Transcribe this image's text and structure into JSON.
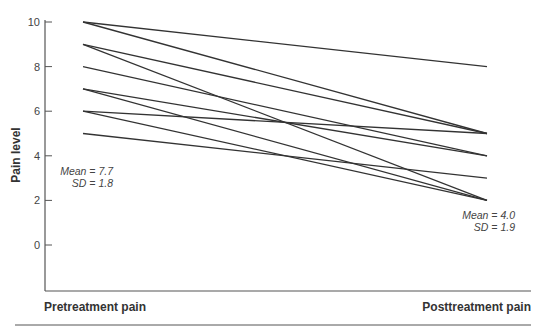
{
  "chart_data": {
    "type": "line",
    "title": "",
    "xlabel": "",
    "ylabel": "Pain level",
    "categories": [
      "Pretreatment pain",
      "Posttreatment pain"
    ],
    "ylim": [
      -2,
      10
    ],
    "yticks": [
      0,
      2,
      4,
      6,
      8,
      10
    ],
    "grid": false,
    "legend": null,
    "series": [
      {
        "name": "Patient 1",
        "values": [
          10,
          8
        ]
      },
      {
        "name": "Patient 2",
        "values": [
          10,
          5
        ]
      },
      {
        "name": "Patient 3",
        "values": [
          9,
          5
        ]
      },
      {
        "name": "Patient 4",
        "values": [
          9,
          2
        ]
      },
      {
        "name": "Patient 5",
        "values": [
          8,
          4
        ]
      },
      {
        "name": "Patient 6",
        "values": [
          7,
          4
        ]
      },
      {
        "name": "Patient 7",
        "values": [
          7,
          2
        ]
      },
      {
        "name": "Patient 8",
        "values": [
          6,
          5
        ]
      },
      {
        "name": "Patient 9",
        "values": [
          6,
          2
        ]
      },
      {
        "name": "Patient 10",
        "values": [
          5,
          3
        ]
      }
    ],
    "annotations": [
      {
        "text": "Mean = 7.7",
        "position": "left"
      },
      {
        "text": "SD = 1.8",
        "position": "left"
      },
      {
        "text": "Mean = 4.0",
        "position": "right"
      },
      {
        "text": "SD = 1.9",
        "position": "right"
      }
    ]
  },
  "labels": {
    "y_axis": "Pain level",
    "x_left": "Pretreatment pain",
    "x_right": "Posttreatment pain",
    "pre_mean": "Mean = 7.7",
    "pre_sd": "SD = 1.8",
    "post_mean": "Mean = 4.0",
    "post_sd": "SD = 1.9"
  },
  "colors": {
    "line": "#333333",
    "axis": "#555555"
  }
}
